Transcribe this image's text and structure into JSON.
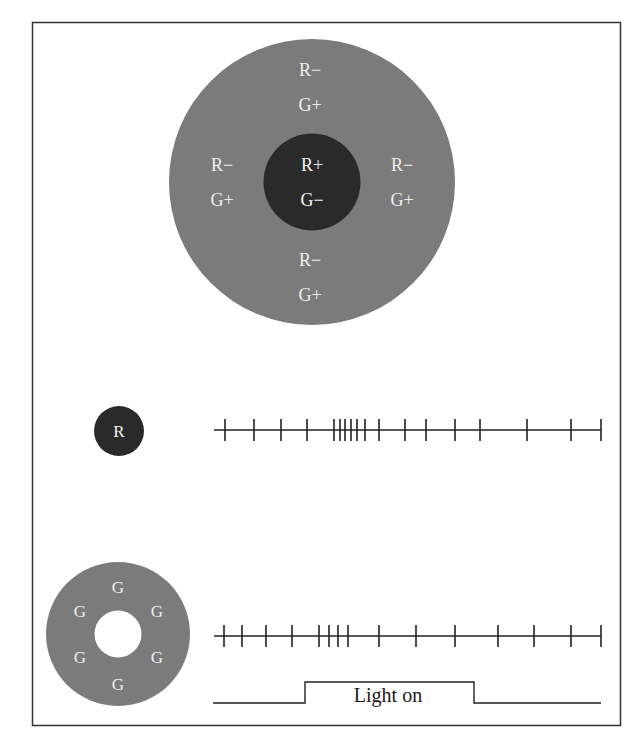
{
  "colors": {
    "frame": "#333333",
    "surround_gray": "#7b7b7b",
    "center_dark": "#2a2a2a",
    "label_text": "#eeeeee",
    "trace": "#222222"
  },
  "receptive_field": {
    "center": {
      "labels": [
        "R+",
        "G−"
      ]
    },
    "surround": {
      "top": [
        "R−",
        "G+"
      ],
      "left": [
        "R−",
        "G+"
      ],
      "right": [
        "R−",
        "G+"
      ],
      "bottom": [
        "R−",
        "G+"
      ]
    }
  },
  "red_stimulus": {
    "label": "R",
    "spike_times_px": [
      225,
      254,
      281,
      307,
      334,
      340,
      345,
      351,
      357,
      365,
      379,
      405,
      426,
      455,
      480,
      527,
      571,
      601
    ]
  },
  "green_annulus_stimulus": {
    "labels": [
      "G",
      "G",
      "G",
      "G",
      "G",
      "G"
    ],
    "spike_times_px": [
      224,
      242,
      266,
      292,
      319,
      329,
      338,
      348,
      379,
      416,
      455,
      498,
      534,
      571,
      601
    ]
  },
  "light_trace": {
    "label": "Light on",
    "on_start_px": 305,
    "on_end_px": 474
  }
}
